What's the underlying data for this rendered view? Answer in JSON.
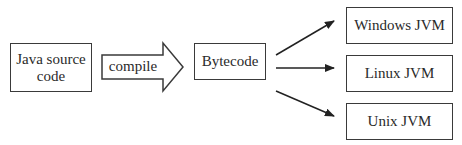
{
  "diagram": {
    "nodes": {
      "source": {
        "label": "Java source code",
        "line1": "Java source",
        "line2": "code"
      },
      "compile": {
        "label": "compile"
      },
      "bytecode": {
        "label": "Bytecode"
      },
      "windows": {
        "label": "Windows JVM"
      },
      "linux": {
        "label": "Linux JVM"
      },
      "unix": {
        "label": "Unix JVM"
      }
    },
    "edges": [
      {
        "from": "source",
        "to": "bytecode",
        "label": "compile",
        "style": "block-arrow"
      },
      {
        "from": "bytecode",
        "to": "windows",
        "style": "arrow"
      },
      {
        "from": "bytecode",
        "to": "linux",
        "style": "arrow"
      },
      {
        "from": "bytecode",
        "to": "unix",
        "style": "arrow"
      }
    ]
  }
}
